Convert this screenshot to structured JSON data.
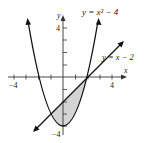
{
  "diagram": {
    "curve1_label": "y = x² − 4",
    "curve2_label": "y = x − 2",
    "x_axis_label": "x",
    "y_axis_label": "y",
    "tick_labels": {
      "x_neg": "−4",
      "x_pos": "4",
      "y_pos": "4",
      "y_neg": "−4"
    },
    "shaded_region": "area between y = x − 2 and y = x² − 4 for −1 ≤ x ≤ 2",
    "intersections": [
      [
        -1,
        -3
      ],
      [
        2,
        0
      ]
    ],
    "colors": {
      "stroke": "#111111",
      "shade": "#d4d4d4",
      "axes": "#333333"
    }
  }
}
